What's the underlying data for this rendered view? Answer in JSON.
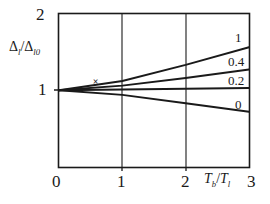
{
  "figure": {
    "background_color": "#ffffff",
    "line_color": "#1a1a1a"
  },
  "chart_data": {
    "type": "line",
    "title": "",
    "xlabel": "Tb/Tl",
    "ylabel": "Δl/Δl0",
    "xlim": [
      0,
      3
    ],
    "ylim": [
      0,
      2
    ],
    "xticks": [
      "0",
      "1",
      "2",
      "3"
    ],
    "xtick_values": [
      0,
      1,
      2,
      3
    ],
    "yticks": [
      "1",
      "2"
    ],
    "ytick_values": [
      1,
      2
    ],
    "grid": "vertical gridlines at x = 1 and x = 2",
    "legend": "curve labels placed at right end of each curve",
    "series": [
      {
        "name": "1",
        "label": "1",
        "x": [
          0,
          1,
          2,
          3
        ],
        "values": [
          1.0,
          1.12,
          1.33,
          1.56
        ]
      },
      {
        "name": "0.4",
        "label": "0.4",
        "x": [
          0,
          1,
          2,
          3
        ],
        "values": [
          1.0,
          1.06,
          1.16,
          1.27
        ]
      },
      {
        "name": "0.2",
        "label": "0.2",
        "x": [
          0,
          1,
          2,
          3
        ],
        "values": [
          1.0,
          1.01,
          1.02,
          1.03
        ]
      },
      {
        "name": "0",
        "label": "0",
        "x": [
          0,
          1,
          2,
          3
        ],
        "values": [
          1.0,
          0.94,
          0.83,
          0.72
        ]
      }
    ],
    "annotations": [
      {
        "name": "x-marker",
        "text": "×",
        "x": 0.58,
        "y": 1.09
      }
    ]
  },
  "axis_labels": {
    "y_axis_title_delta": "Δ",
    "y_axis_title_sub1": "l",
    "y_axis_title_slash": "/",
    "y_axis_title_delta2": "Δ",
    "y_axis_title_sub2": "l0",
    "x_axis_title_t1": "T",
    "x_axis_title_sub1": "b",
    "x_axis_title_slash": "/",
    "x_axis_title_t2": "T",
    "x_axis_title_sub2": "l"
  },
  "ticks": {
    "y_top": "2",
    "y_mid": "1",
    "x_0": "0",
    "x_1": "1",
    "x_2": "2",
    "x_3": "3"
  },
  "curve_labels": {
    "c1": "1",
    "c2": "0.4",
    "c3": "0.2",
    "c4": "0"
  },
  "marker": {
    "cross": "×"
  }
}
